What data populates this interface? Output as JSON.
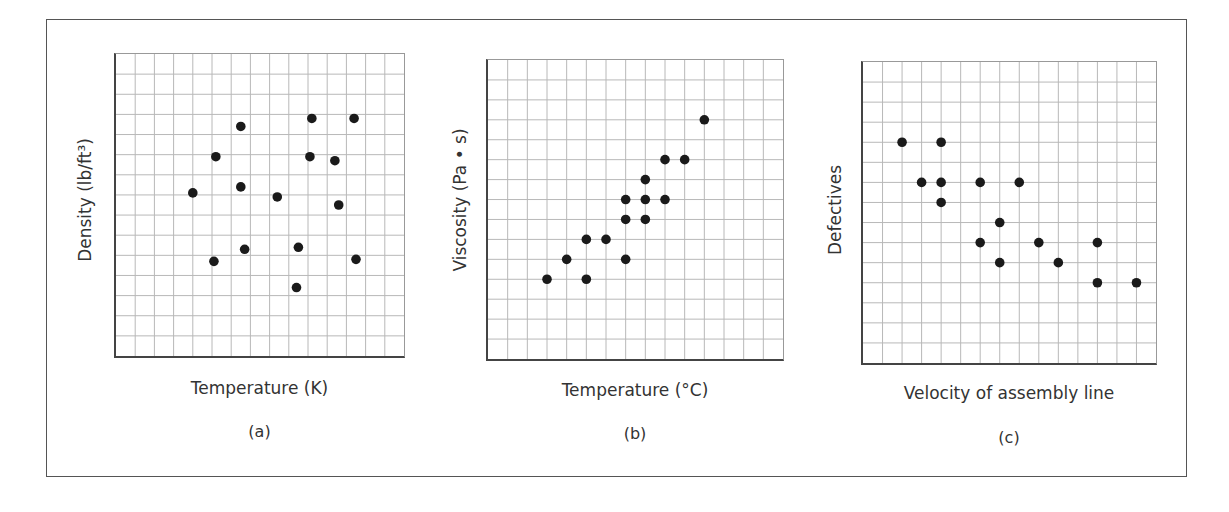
{
  "figure": {
    "charts": [
      {
        "id": "a",
        "xlabel": "Temperature (K)",
        "ylabel": "Density (lb/ft³)",
        "caption": "(a)"
      },
      {
        "id": "b",
        "xlabel": "Temperature (°C)",
        "ylabel": "Viscosity (Pa • s)",
        "caption": "(b)"
      },
      {
        "id": "c",
        "xlabel": "Velocity of assembly line",
        "ylabel": "Defectives",
        "caption": "(c)"
      }
    ],
    "colors": {
      "point": "#1a1a1a",
      "grid": "#b8b8b8",
      "axis": "#444444",
      "frame": "#555555"
    }
  },
  "chart_data": [
    {
      "type": "scatter",
      "title": "(a)",
      "xlabel": "Temperature (K)",
      "ylabel": "Density (lb/ft³)",
      "grid": true,
      "grid_divisions": [
        15,
        15
      ],
      "xlim": [
        0,
        15
      ],
      "ylim": [
        0,
        15
      ],
      "ticks_labeled": false,
      "x": [
        6.5,
        10.2,
        12.4,
        5.2,
        10.1,
        11.4,
        4.0,
        6.5,
        8.4,
        11.6,
        6.7,
        9.5,
        5.1,
        12.5,
        9.4
      ],
      "y": [
        11.4,
        11.8,
        11.8,
        9.9,
        9.9,
        9.7,
        8.1,
        8.4,
        7.9,
        7.5,
        5.3,
        5.4,
        4.7,
        4.8,
        3.4
      ],
      "note": "no correlation"
    },
    {
      "type": "scatter",
      "title": "(b)",
      "xlabel": "Temperature (°C)",
      "ylabel": "Viscosity (Pa • s)",
      "grid": true,
      "grid_divisions": [
        15,
        15
      ],
      "xlim": [
        0,
        15
      ],
      "ylim": [
        0,
        15
      ],
      "ticks_labeled": false,
      "x": [
        3,
        4,
        5,
        5,
        6,
        7,
        7,
        7,
        8,
        8,
        8,
        9,
        9,
        10,
        11
      ],
      "y": [
        4,
        5,
        4,
        6,
        6,
        5,
        7,
        8,
        7,
        8,
        9,
        8,
        10,
        10,
        12
      ],
      "note": "positive correlation"
    },
    {
      "type": "scatter",
      "title": "(c)",
      "xlabel": "Velocity of assembly line",
      "ylabel": "Defectives",
      "grid": true,
      "grid_divisions": [
        15,
        15
      ],
      "xlim": [
        0,
        15
      ],
      "ylim": [
        0,
        15
      ],
      "ticks_labeled": false,
      "x": [
        2,
        4,
        3,
        4,
        6,
        8,
        4,
        7,
        6,
        9,
        12,
        7,
        10,
        12,
        14
      ],
      "y": [
        11,
        11,
        9,
        9,
        9,
        9,
        8,
        7,
        6,
        6,
        6,
        5,
        5,
        4,
        4
      ],
      "note": "negative correlation"
    }
  ]
}
